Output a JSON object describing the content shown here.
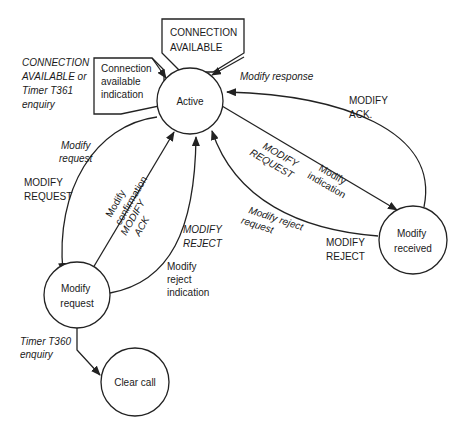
{
  "diagram": {
    "type": "state-transition",
    "states": [
      {
        "id": "active",
        "label": [
          "Active"
        ]
      },
      {
        "id": "modify_request",
        "label": [
          "Modify",
          "request"
        ]
      },
      {
        "id": "modify_received",
        "label": [
          "Modify",
          "received"
        ]
      },
      {
        "id": "clear_call",
        "label": [
          "Clear call"
        ]
      }
    ],
    "signals": {
      "connection_available_in": [
        "CONNECTION",
        "AVAILABLE"
      ],
      "connection_available_indication": [
        "Connection",
        "available",
        "indication"
      ]
    },
    "labels": {
      "conn_avail_or_timer": [
        "CONNECTION",
        "AVAILABLE or",
        "Timer T361",
        "enquiry"
      ],
      "modify_response": "Modify response",
      "modify_ack_right": [
        "MODIFY",
        "ACK."
      ],
      "modify_request_italic": [
        "Modify",
        "request"
      ],
      "modify_request_caps": [
        "MODIFY",
        "REQUEST"
      ],
      "modify_confirmation": [
        "Modify",
        "confirmation"
      ],
      "modify_ack_mid": [
        "MODIFY",
        "ACK"
      ],
      "modify_reject_italic": [
        "MODIFY",
        "REJECT"
      ],
      "modify_reject_indication": [
        "Modify",
        "reject",
        "indication"
      ],
      "modify_request_diag": [
        "MODIFY",
        "REQUEST"
      ],
      "modify_indication": [
        "Modify",
        "indication"
      ],
      "modify_reject_request": [
        "Modify reject",
        "request"
      ],
      "modify_reject_caps": [
        "MODIFY",
        "REJECT"
      ],
      "timer_t360": [
        "Timer T360",
        "enquiry"
      ]
    }
  }
}
